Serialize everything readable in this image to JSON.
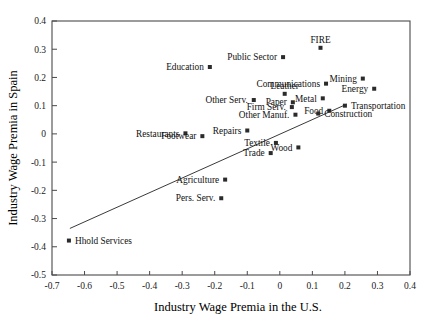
{
  "chart_data": {
    "type": "scatter",
    "title": "",
    "xlabel": "Industry Wage Premia in the U.S.",
    "ylabel": "Industry Wage Premia in Spain",
    "xlim": [
      -0.7,
      0.4
    ],
    "ylim": [
      -0.5,
      0.4
    ],
    "xticks": [
      "-0.7",
      "-0.6",
      "-0.5",
      "-0.4",
      "-0.3",
      "-0.2",
      "-0.1",
      "0",
      "0.1",
      "0.2",
      "0.3",
      "0.4"
    ],
    "xtickvals": [
      -0.7,
      -0.6,
      -0.5,
      -0.4,
      -0.3,
      -0.2,
      -0.1,
      0,
      0.1,
      0.2,
      0.3,
      0.4
    ],
    "yticks": [
      "0.4",
      "0.3",
      "0.2",
      "0.1",
      "0",
      "-0.1",
      "-0.2",
      "-0.3",
      "-0.4",
      "-0.5"
    ],
    "ytickvals": [
      0.4,
      0.3,
      0.2,
      0.1,
      0,
      -0.1,
      -0.2,
      -0.3,
      -0.4,
      -0.5
    ],
    "grid": false,
    "legend": "none",
    "marker_style": "small-filled-square",
    "fit_line": {
      "label": "regression line",
      "x_start": -0.645,
      "y_start": -0.335,
      "x_end": 0.205,
      "y_end": 0.105
    },
    "points": [
      {
        "label": "FIRE",
        "x": 0.125,
        "y": 0.305,
        "label_pos": "above"
      },
      {
        "label": "Public Sector",
        "x": 0.01,
        "y": 0.272,
        "label_pos": "left"
      },
      {
        "label": "Education",
        "x": -0.215,
        "y": 0.237,
        "label_pos": "left"
      },
      {
        "label": "Mining",
        "x": 0.255,
        "y": 0.196,
        "label_pos": "left"
      },
      {
        "label": "Communications",
        "x": 0.142,
        "y": 0.178,
        "label_pos": "left"
      },
      {
        "label": "Energy",
        "x": 0.29,
        "y": 0.16,
        "label_pos": "left"
      },
      {
        "label": "Leather",
        "x": 0.015,
        "y": 0.142,
        "label_pos": "above"
      },
      {
        "label": "Metal",
        "x": 0.132,
        "y": 0.126,
        "label_pos": "left"
      },
      {
        "label": "Other Serv.",
        "x": -0.08,
        "y": 0.12,
        "label_pos": "left"
      },
      {
        "label": "Paper",
        "x": 0.04,
        "y": 0.112,
        "label_pos": "left"
      },
      {
        "label": "Transportation",
        "x": 0.2,
        "y": 0.1,
        "label_pos": "right"
      },
      {
        "label": "Firm Serv.",
        "x": 0.037,
        "y": 0.095,
        "label_pos": "left"
      },
      {
        "label": "Food",
        "x": 0.152,
        "y": 0.082,
        "label_pos": "left"
      },
      {
        "label": "Other Manuf.",
        "x": 0.048,
        "y": 0.068,
        "label_pos": "left"
      },
      {
        "label": "Construction",
        "x": 0.118,
        "y": 0.072,
        "label_pos": "right"
      },
      {
        "label": "Repairs",
        "x": -0.1,
        "y": 0.012,
        "label_pos": "left"
      },
      {
        "label": "Restaurants",
        "x": -0.29,
        "y": 0.002,
        "label_pos": "left"
      },
      {
        "label": "Footwear",
        "x": -0.238,
        "y": -0.008,
        "label_pos": "left"
      },
      {
        "label": "Textile",
        "x": -0.012,
        "y": -0.032,
        "label_pos": "left"
      },
      {
        "label": "Wood",
        "x": 0.057,
        "y": -0.048,
        "label_pos": "left"
      },
      {
        "label": "Trade",
        "x": -0.028,
        "y": -0.068,
        "label_pos": "left"
      },
      {
        "label": "Agriculture",
        "x": -0.168,
        "y": -0.162,
        "label_pos": "left"
      },
      {
        "label": "Pers. Serv.",
        "x": -0.18,
        "y": -0.228,
        "label_pos": "left"
      },
      {
        "label": "Hhold Services",
        "x": -0.648,
        "y": -0.378,
        "label_pos": "right"
      }
    ]
  }
}
